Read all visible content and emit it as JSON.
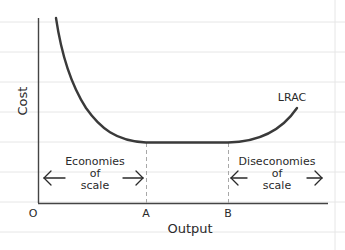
{
  "diagram": {
    "y_axis_label": "Cost",
    "x_axis_label": "Output",
    "origin_label": "O",
    "curve_label": "LRAC",
    "points": {
      "A": "A",
      "B": "B"
    },
    "regions": {
      "economies": {
        "line1": "Economies",
        "line2": "of",
        "line3": "scale"
      },
      "diseconomies": {
        "line1": "Diseconomies",
        "line2": "of",
        "line3": "scale"
      }
    },
    "arrows": {
      "left": "←",
      "right": "→"
    },
    "colors": {
      "background": "#ffffff",
      "grid": "#e6e6e6",
      "axis": "#444444",
      "curve": "#3a3a3a",
      "dashed": "#a8a8a8",
      "text": "#2a2a2a"
    }
  }
}
